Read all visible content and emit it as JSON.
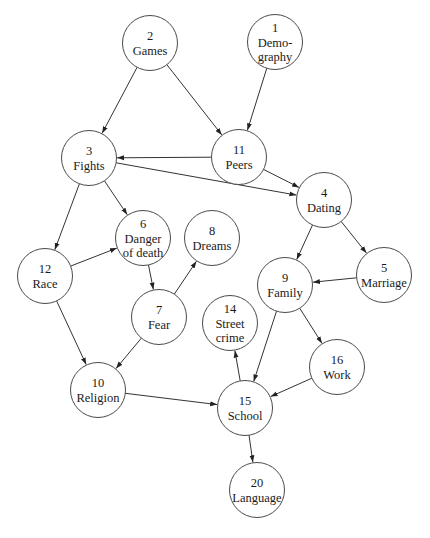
{
  "diagram": {
    "type": "directed-graph",
    "node_radius": 27.5,
    "colors": {
      "node_stroke": "#4a4a4a",
      "edge": "#333333",
      "text": "#1a1a1a",
      "background": "#ffffff"
    },
    "nodes": [
      {
        "id": "1",
        "lines": [
          "1",
          "Demo-",
          "graphy"
        ],
        "x": 275,
        "y": 42
      },
      {
        "id": "2",
        "lines": [
          "2",
          "Games"
        ],
        "x": 150,
        "y": 43
      },
      {
        "id": "3",
        "lines": [
          "3",
          "Fights"
        ],
        "x": 89,
        "y": 158
      },
      {
        "id": "11",
        "lines": [
          "11",
          "Peers"
        ],
        "x": 239,
        "y": 157
      },
      {
        "id": "4",
        "lines": [
          "4",
          "Dating"
        ],
        "x": 324,
        "y": 200
      },
      {
        "id": "6",
        "lines": [
          "6",
          "Danger",
          "of death"
        ],
        "x": 143,
        "y": 238
      },
      {
        "id": "8",
        "lines": [
          "8",
          "Dreams"
        ],
        "x": 212,
        "y": 238
      },
      {
        "id": "12",
        "lines": [
          "12",
          "Race"
        ],
        "x": 45,
        "y": 276
      },
      {
        "id": "9",
        "lines": [
          "9",
          "Family"
        ],
        "x": 285,
        "y": 285
      },
      {
        "id": "5",
        "lines": [
          "5",
          "Marriage"
        ],
        "x": 384,
        "y": 275
      },
      {
        "id": "7",
        "lines": [
          "7",
          "Fear"
        ],
        "x": 159,
        "y": 317
      },
      {
        "id": "14",
        "lines": [
          "14",
          "Street",
          "crime"
        ],
        "x": 230,
        "y": 323
      },
      {
        "id": "16",
        "lines": [
          "16",
          "Work"
        ],
        "x": 337,
        "y": 367
      },
      {
        "id": "10",
        "lines": [
          "10",
          "Religion"
        ],
        "x": 98,
        "y": 390
      },
      {
        "id": "15",
        "lines": [
          "15",
          "School"
        ],
        "x": 245,
        "y": 408
      },
      {
        "id": "20",
        "lines": [
          "20",
          "Language"
        ],
        "x": 257,
        "y": 490
      }
    ],
    "edges": [
      {
        "from": "2",
        "to": "3"
      },
      {
        "from": "2",
        "to": "11"
      },
      {
        "from": "1",
        "to": "11"
      },
      {
        "from": "11",
        "to": "3"
      },
      {
        "from": "11",
        "to": "4"
      },
      {
        "from": "3",
        "to": "4"
      },
      {
        "from": "3",
        "to": "6"
      },
      {
        "from": "3",
        "to": "12"
      },
      {
        "from": "12",
        "to": "6"
      },
      {
        "from": "12",
        "to": "10"
      },
      {
        "from": "6",
        "to": "7"
      },
      {
        "from": "7",
        "to": "8"
      },
      {
        "from": "7",
        "to": "10"
      },
      {
        "from": "4",
        "to": "9"
      },
      {
        "from": "4",
        "to": "5"
      },
      {
        "from": "5",
        "to": "9"
      },
      {
        "from": "9",
        "to": "15"
      },
      {
        "from": "9",
        "to": "16"
      },
      {
        "from": "16",
        "to": "15"
      },
      {
        "from": "15",
        "to": "14"
      },
      {
        "from": "10",
        "to": "15"
      },
      {
        "from": "15",
        "to": "20"
      }
    ]
  }
}
